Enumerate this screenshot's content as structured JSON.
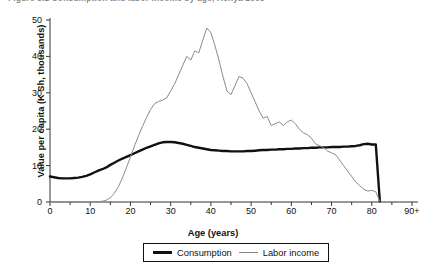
{
  "figure": {
    "title": "Figure 3.1  Consumption and labor income by age, Kenya 2005",
    "title_clipped": true
  },
  "legend": {
    "position": "bottom-center",
    "items": [
      {
        "label": "Consumption",
        "color": "#111111",
        "style": "thick"
      },
      {
        "label": "Labor income",
        "color": "#8a8a8a",
        "style": "thin"
      }
    ]
  },
  "chart_data": {
    "type": "line",
    "title": "Figure 3.1  Consumption and labor income by age, Kenya 2005",
    "xlabel": "Age (years)",
    "ylabel": "Value per capita (K Sh, thousands)",
    "xlim": [
      0,
      90
    ],
    "ylim": [
      0,
      50
    ],
    "xticks": [
      0,
      10,
      20,
      30,
      40,
      50,
      60,
      70,
      80,
      90
    ],
    "xticklabels": [
      "0",
      "10",
      "20",
      "30",
      "40",
      "50",
      "60",
      "70",
      "80",
      "90+"
    ],
    "yticks": [
      0,
      10,
      20,
      30,
      40,
      50
    ],
    "yticklabels": [
      "0",
      "10",
      "20",
      "30",
      "40",
      "50"
    ],
    "grid": false,
    "minor_xticks_interval": 5,
    "x": [
      0,
      1,
      2,
      3,
      4,
      5,
      6,
      7,
      8,
      9,
      10,
      11,
      12,
      13,
      14,
      15,
      16,
      17,
      18,
      19,
      20,
      21,
      22,
      23,
      24,
      25,
      26,
      27,
      28,
      29,
      30,
      31,
      32,
      33,
      34,
      35,
      36,
      37,
      38,
      39,
      40,
      41,
      42,
      43,
      44,
      45,
      46,
      47,
      48,
      49,
      50,
      51,
      52,
      53,
      54,
      55,
      56,
      57,
      58,
      59,
      60,
      61,
      62,
      63,
      64,
      65,
      66,
      67,
      68,
      69,
      70,
      71,
      72,
      73,
      74,
      75,
      76,
      77,
      78,
      79,
      80,
      81,
      82
    ],
    "series": [
      {
        "name": "Consumption",
        "color": "#111111",
        "linewidth": 2.4,
        "values": [
          7.0,
          6.8,
          6.6,
          6.5,
          6.5,
          6.5,
          6.6,
          6.7,
          6.9,
          7.2,
          7.6,
          8.1,
          8.6,
          9.0,
          9.5,
          10.2,
          10.8,
          11.4,
          11.9,
          12.4,
          12.9,
          13.4,
          13.9,
          14.4,
          14.9,
          15.3,
          15.7,
          16.1,
          16.4,
          16.5,
          16.5,
          16.4,
          16.2,
          16.0,
          15.7,
          15.4,
          15.1,
          14.9,
          14.7,
          14.5,
          14.3,
          14.2,
          14.1,
          14.0,
          14.0,
          13.9,
          13.9,
          13.9,
          13.9,
          14.0,
          14.0,
          14.1,
          14.2,
          14.3,
          14.3,
          14.4,
          14.4,
          14.5,
          14.5,
          14.6,
          14.6,
          14.7,
          14.7,
          14.8,
          14.8,
          14.9,
          14.9,
          15.0,
          15.0,
          15.0,
          15.1,
          15.1,
          15.1,
          15.2,
          15.2,
          15.3,
          15.4,
          15.6,
          15.9,
          16.0,
          15.8,
          15.8,
          0.2
        ]
      },
      {
        "name": "Labor income",
        "color": "#8a8a8a",
        "linewidth": 1.0,
        "values": [
          0.0,
          0.0,
          0.0,
          0.0,
          0.0,
          0.0,
          0.0,
          0.0,
          0.0,
          0.0,
          0.0,
          0.05,
          0.1,
          0.2,
          0.5,
          1.2,
          2.4,
          4.2,
          6.6,
          9.4,
          12.4,
          15.4,
          18.2,
          20.8,
          23.2,
          25.4,
          27.0,
          27.6,
          28.0,
          28.6,
          30.5,
          32.5,
          35.0,
          37.5,
          40.0,
          39.0,
          41.5,
          41.0,
          44.5,
          47.8,
          46.5,
          43.0,
          39.0,
          34.5,
          30.5,
          29.5,
          32.0,
          34.5,
          34.0,
          32.5,
          30.0,
          27.5,
          25.0,
          23.0,
          23.5,
          21.0,
          21.5,
          22.0,
          21.0,
          22.0,
          22.5,
          21.5,
          20.0,
          19.0,
          18.5,
          17.5,
          16.0,
          15.5,
          15.0,
          14.0,
          13.5,
          13.0,
          11.5,
          10.0,
          8.5,
          7.0,
          5.5,
          4.5,
          3.5,
          3.0,
          3.2,
          2.8,
          0.2
        ]
      }
    ],
    "annotations": {
      "labor_peak": {
        "age": 39,
        "value": 47.8
      },
      "labor_secondary_peak": {
        "age": 47,
        "value": 34.5
      },
      "consumption_peak": {
        "age": 29,
        "value": 16.5
      },
      "crossover_young": {
        "age": 26
      },
      "crossover_old": {
        "age": 58
      },
      "terminal_drop_age": 82
    }
  }
}
